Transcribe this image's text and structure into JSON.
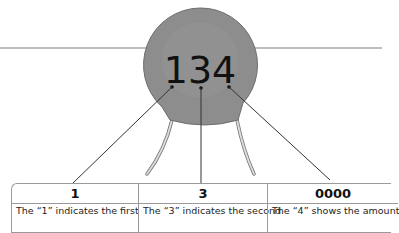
{
  "component": {
    "marking": "134",
    "body_color": "#8a8a8a",
    "lead_color": "#d0d0d0"
  },
  "table": {
    "columns": [
      {
        "header": "1",
        "description": "The “1” indicates the first"
      },
      {
        "header": "3",
        "description": "The “3” indicates the second"
      },
      {
        "header": "0000",
        "description": "The “4” shows the amount"
      }
    ]
  }
}
